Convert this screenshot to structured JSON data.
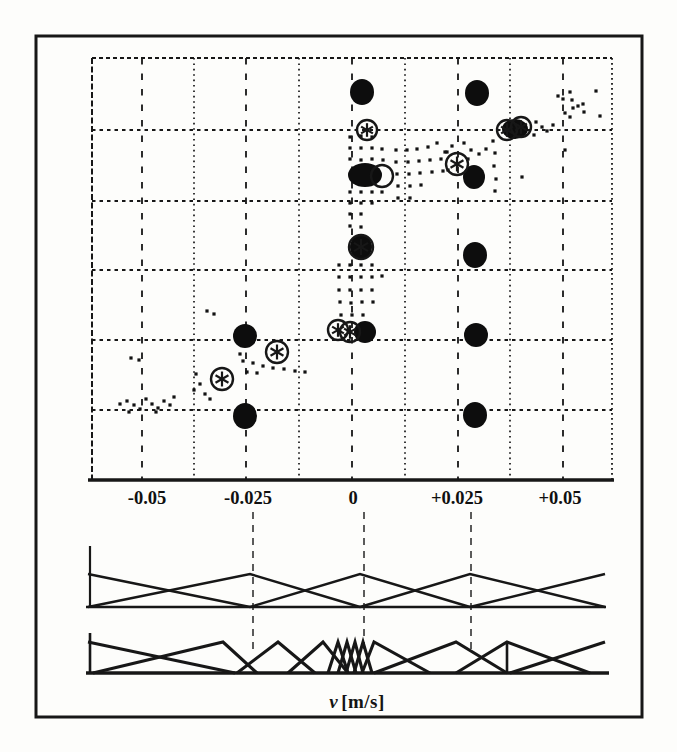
{
  "figure": {
    "xlabel_var": "v",
    "xlabel_units": "[m/s]",
    "ink": "#171717",
    "paper": "#fdfdfb"
  },
  "chart_data": {
    "type": "scatter",
    "title": "",
    "xlabel": "v [m/s]",
    "ylabel": "",
    "x_axis_units": "m/s",
    "x_tick_labels": [
      "-0.05",
      "-0.025",
      "0",
      "+0.025",
      "+0.05"
    ],
    "x_tick_values": [
      -0.05,
      -0.025,
      0,
      0.025,
      0.05
    ],
    "x_tick_px": [
      147,
      248,
      353,
      457,
      560
    ],
    "tick_label_baseline_y": 504,
    "plot_px": {
      "left": 92,
      "right": 612,
      "top": 58,
      "bottom": 480
    },
    "frame_px": {
      "left": 36,
      "top": 36,
      "right": 642,
      "bottom": 717
    },
    "grid": {
      "h_lines_y": [
        130,
        201,
        270,
        340,
        410
      ],
      "v_major_x": [
        142,
        246,
        352,
        458,
        563
      ],
      "v_minor_x": [
        194,
        299,
        405,
        510
      ]
    },
    "big_dots": [
      {
        "x": 362,
        "y": 92,
        "rx": 12,
        "ry": 13,
        "v": 0.002
      },
      {
        "x": 477,
        "y": 93,
        "rx": 12,
        "ry": 13,
        "v": 0.03
      },
      {
        "x": 365,
        "y": 175,
        "rx": 17,
        "ry": 12,
        "v": 0.003
      },
      {
        "x": 474,
        "y": 177,
        "rx": 11,
        "ry": 12,
        "v": 0.029
      },
      {
        "x": 475,
        "y": 255,
        "rx": 12,
        "ry": 13,
        "v": 0.029
      },
      {
        "x": 361,
        "y": 247,
        "rx": 11,
        "ry": 12,
        "v": 0.002
      },
      {
        "x": 515,
        "y": 129,
        "rx": 13,
        "ry": 10,
        "v": 0.039
      },
      {
        "x": 245,
        "y": 336,
        "rx": 12,
        "ry": 12,
        "v": -0.026
      },
      {
        "x": 365,
        "y": 332,
        "rx": 11,
        "ry": 11,
        "v": 0.003
      },
      {
        "x": 476,
        "y": 335,
        "rx": 12,
        "ry": 12,
        "v": 0.03
      },
      {
        "x": 245,
        "y": 416,
        "rx": 12,
        "ry": 13,
        "v": -0.026
      },
      {
        "x": 475,
        "y": 415,
        "rx": 12,
        "ry": 13,
        "v": 0.029
      }
    ],
    "ring_markers": [
      {
        "x": 367,
        "y": 130,
        "r": 10,
        "ast": true
      },
      {
        "x": 507,
        "y": 130,
        "r": 10,
        "ast": true
      },
      {
        "x": 521,
        "y": 127,
        "r": 10,
        "ast": true
      },
      {
        "x": 457,
        "y": 164,
        "r": 11,
        "ast": true
      },
      {
        "x": 382,
        "y": 176,
        "r": 11,
        "ast": false
      },
      {
        "x": 361,
        "y": 247,
        "r": 12,
        "ast": true
      },
      {
        "x": 338,
        "y": 330,
        "r": 10,
        "ast": true
      },
      {
        "x": 350,
        "y": 332,
        "r": 10,
        "ast": true
      },
      {
        "x": 277,
        "y": 352,
        "r": 11,
        "ast": true
      },
      {
        "x": 222,
        "y": 379,
        "r": 11,
        "ast": true
      }
    ],
    "points_px": [
      [
        350,
        137
      ],
      [
        361,
        136
      ],
      [
        372,
        137
      ],
      [
        350,
        148
      ],
      [
        361,
        148
      ],
      [
        372,
        148
      ],
      [
        382,
        149
      ],
      [
        350,
        159
      ],
      [
        361,
        160
      ],
      [
        372,
        159
      ],
      [
        383,
        160
      ],
      [
        350,
        192
      ],
      [
        361,
        192
      ],
      [
        372,
        192
      ],
      [
        382,
        192
      ],
      [
        350,
        203
      ],
      [
        361,
        203
      ],
      [
        372,
        203
      ],
      [
        350,
        214
      ],
      [
        361,
        214
      ],
      [
        350,
        226
      ],
      [
        361,
        227
      ],
      [
        396,
        150
      ],
      [
        407,
        150
      ],
      [
        417,
        149
      ],
      [
        428,
        147
      ],
      [
        396,
        162
      ],
      [
        408,
        162
      ],
      [
        419,
        161
      ],
      [
        430,
        160
      ],
      [
        441,
        159
      ],
      [
        397,
        174
      ],
      [
        409,
        174
      ],
      [
        420,
        173
      ],
      [
        432,
        172
      ],
      [
        398,
        186
      ],
      [
        410,
        186
      ],
      [
        421,
        185
      ],
      [
        398,
        198
      ],
      [
        410,
        198
      ],
      [
        443,
        171
      ],
      [
        437,
        143
      ],
      [
        447,
        152
      ],
      [
        493,
        141
      ],
      [
        495,
        153
      ],
      [
        494,
        166
      ],
      [
        496,
        179
      ],
      [
        495,
        191
      ],
      [
        536,
        122
      ],
      [
        542,
        127
      ],
      [
        547,
        131
      ],
      [
        534,
        135
      ],
      [
        553,
        125
      ],
      [
        558,
        96
      ],
      [
        563,
        99
      ],
      [
        570,
        92
      ],
      [
        572,
        100
      ],
      [
        573,
        108
      ],
      [
        578,
        106
      ],
      [
        583,
        104
      ],
      [
        584,
        112
      ],
      [
        565,
        113
      ],
      [
        570,
        117
      ],
      [
        596,
        91
      ],
      [
        600,
        116
      ],
      [
        522,
        177
      ],
      [
        565,
        150
      ],
      [
        445,
        152
      ],
      [
        452,
        146
      ],
      [
        464,
        143
      ],
      [
        471,
        150
      ],
      [
        479,
        154
      ],
      [
        448,
        170
      ],
      [
        468,
        159
      ],
      [
        486,
        149
      ],
      [
        339,
        265
      ],
      [
        350,
        265
      ],
      [
        361,
        265
      ],
      [
        372,
        265
      ],
      [
        339,
        277
      ],
      [
        350,
        277
      ],
      [
        361,
        277
      ],
      [
        372,
        277
      ],
      [
        382,
        276
      ],
      [
        339,
        290
      ],
      [
        350,
        290
      ],
      [
        361,
        290
      ],
      [
        372,
        290
      ],
      [
        340,
        302
      ],
      [
        351,
        303
      ],
      [
        362,
        302
      ],
      [
        373,
        302
      ],
      [
        341,
        315
      ],
      [
        352,
        315
      ],
      [
        363,
        315
      ],
      [
        243,
        361
      ],
      [
        253,
        363
      ],
      [
        263,
        366
      ],
      [
        273,
        368
      ],
      [
        284,
        369
      ],
      [
        295,
        371
      ],
      [
        247,
        372
      ],
      [
        257,
        373
      ],
      [
        305,
        372
      ],
      [
        240,
        354
      ],
      [
        196,
        374
      ],
      [
        200,
        384
      ],
      [
        194,
        390
      ],
      [
        205,
        394
      ],
      [
        210,
        399
      ],
      [
        207,
        311
      ],
      [
        214,
        314
      ],
      [
        127,
        401
      ],
      [
        134,
        405
      ],
      [
        140,
        409
      ],
      [
        146,
        399
      ],
      [
        152,
        404
      ],
      [
        158,
        408
      ],
      [
        164,
        401
      ],
      [
        170,
        405
      ],
      [
        129,
        412
      ],
      [
        156,
        412
      ],
      [
        174,
        397
      ],
      [
        131,
        358
      ],
      [
        139,
        360
      ],
      [
        120,
        404
      ]
    ],
    "connectors": {
      "x": [
        253,
        364,
        471
      ],
      "y_top": 512,
      "y_bottom": 649
    },
    "membership_upper": {
      "baseline_y": 607,
      "apex_y": 574,
      "x_start": 86,
      "x_end": 606,
      "stub_x": 90,
      "stub_top": 546,
      "peaks": [
        88,
        250,
        360,
        470,
        605
      ]
    },
    "membership_lower": {
      "baseline_y": 673,
      "apex_y": 642,
      "x_start": 86,
      "x_end": 609,
      "stub_x": 90,
      "stub_top": 633,
      "triangles": [
        [
          88,
          88,
          235
        ],
        [
          223,
          93,
          257
        ],
        [
          278,
          237,
          315
        ],
        [
          323,
          288,
          348
        ],
        [
          338,
          328,
          348
        ],
        [
          347,
          338,
          356
        ],
        [
          355,
          346,
          363
        ],
        [
          363,
          354,
          372
        ],
        [
          374,
          362,
          430
        ],
        [
          456,
          374,
          507
        ],
        [
          507,
          456,
          590
        ],
        [
          605,
          510,
          605
        ]
      ],
      "vertical_x": 507
    }
  }
}
